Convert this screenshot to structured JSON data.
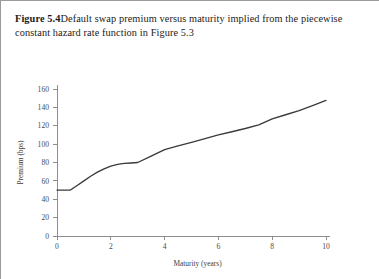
{
  "caption": {
    "label": "Figure 5.4",
    "text": "Default swap premium versus maturity implied from the piecewise constant hazard rate function in Figure 5.3"
  },
  "chart_data": {
    "type": "line",
    "title": "",
    "xlabel": "Maturity (years)",
    "ylabel": "Premium (bps)",
    "xlim": [
      0,
      10
    ],
    "ylim": [
      0,
      160
    ],
    "xticks": [
      0,
      2,
      4,
      6,
      8,
      10
    ],
    "yticks": [
      0,
      20,
      40,
      60,
      80,
      100,
      120,
      140,
      160
    ],
    "grid": false,
    "legend": false,
    "line_color": "#3a3a3a",
    "series": [
      {
        "name": "Default swap premium",
        "x": [
          0.0,
          0.25,
          0.5,
          0.75,
          1.0,
          1.25,
          1.5,
          1.75,
          2.0,
          2.25,
          2.5,
          2.75,
          3.0,
          3.5,
          4.0,
          4.5,
          5.0,
          5.5,
          6.0,
          6.5,
          7.0,
          7.5,
          8.0,
          8.5,
          9.0,
          9.5,
          10.0
        ],
        "values": [
          50,
          50,
          50,
          55,
          60,
          65,
          69.5,
          73,
          76,
          78,
          79,
          79.5,
          80,
          87,
          94,
          98,
          102,
          106,
          110,
          113.5,
          117,
          121,
          127.5,
          132,
          136.5,
          142,
          147.5
        ]
      }
    ]
  }
}
